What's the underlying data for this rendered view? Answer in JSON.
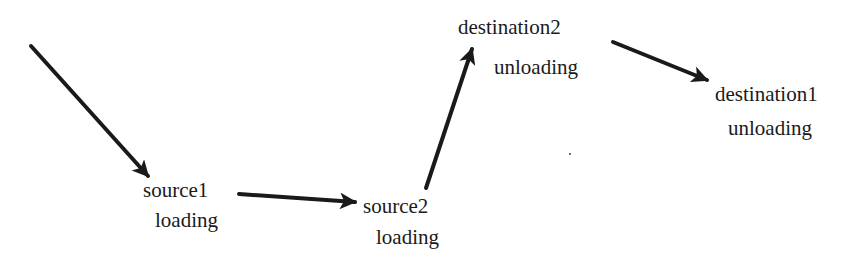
{
  "diagram": {
    "type": "flow",
    "colors": {
      "ink": "#1a1a1a",
      "background": "#ffffff"
    },
    "nodes": [
      {
        "id": "source1",
        "name": "source1",
        "action": "loading"
      },
      {
        "id": "source2",
        "name": "source2",
        "action": "loading"
      },
      {
        "id": "destination2",
        "name": "destination2",
        "action": "unloading"
      },
      {
        "id": "destination1",
        "name": "destination1",
        "action": "unloading"
      }
    ],
    "edges": [
      {
        "from": "start",
        "to": "source1"
      },
      {
        "from": "source1",
        "to": "source2"
      },
      {
        "from": "source2",
        "to": "destination2"
      },
      {
        "from": "destination2",
        "to": "destination1"
      }
    ]
  }
}
